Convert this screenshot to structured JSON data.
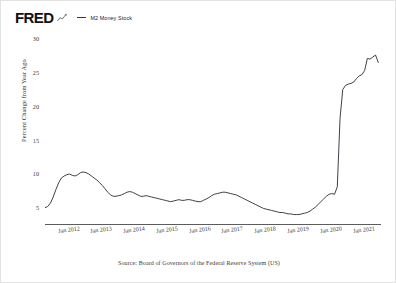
{
  "header": {
    "logo_text": "FRED",
    "logo_mark_icon": "mini-line-chart-icon",
    "legend": [
      {
        "label": "M2 Money Stock",
        "color": "#33383f",
        "swatch_icon": "line-swatch-icon"
      }
    ]
  },
  "source_note": "Source: Board of Governors of the Federal Reserve System (US)",
  "chart_data": {
    "type": "line",
    "title": "",
    "xlabel": "",
    "ylabel": "Percent Change from Year Ago",
    "ylim": [
      2.5,
      31.5
    ],
    "yticks": [
      5,
      10,
      15,
      20,
      25,
      30
    ],
    "ytick_labels": [
      "5",
      "10",
      "15",
      "20",
      "25",
      "30"
    ],
    "xlim": [
      "2011-04",
      "2021-07"
    ],
    "xticks": [
      "2012-01",
      "2013-01",
      "2014-01",
      "2015-01",
      "2016-01",
      "2017-01",
      "2018-01",
      "2019-01",
      "2020-01",
      "2021-01"
    ],
    "xtick_labels": [
      "Jan 2012",
      "Jan 2013",
      "Jan 2014",
      "Jan 2015",
      "Jan 2016",
      "Jan 2017",
      "Jan 2018",
      "Jan 2019",
      "Jan 2020",
      "Jan 2021"
    ],
    "grid": false,
    "legend_position": "top-left",
    "series": [
      {
        "name": "M2 Money Stock",
        "color": "#33383f",
        "x": [
          "2011-04",
          "2011-05",
          "2011-06",
          "2011-07",
          "2011-08",
          "2011-09",
          "2011-10",
          "2011-11",
          "2011-12",
          "2012-01",
          "2012-02",
          "2012-03",
          "2012-04",
          "2012-05",
          "2012-06",
          "2012-07",
          "2012-08",
          "2012-09",
          "2012-10",
          "2012-11",
          "2012-12",
          "2013-01",
          "2013-02",
          "2013-03",
          "2013-04",
          "2013-05",
          "2013-06",
          "2013-07",
          "2013-08",
          "2013-09",
          "2013-10",
          "2013-11",
          "2013-12",
          "2014-01",
          "2014-02",
          "2014-03",
          "2014-04",
          "2014-05",
          "2014-06",
          "2014-07",
          "2014-08",
          "2014-09",
          "2014-10",
          "2014-11",
          "2014-12",
          "2015-01",
          "2015-02",
          "2015-03",
          "2015-04",
          "2015-05",
          "2015-06",
          "2015-07",
          "2015-08",
          "2015-09",
          "2015-10",
          "2015-11",
          "2015-12",
          "2016-01",
          "2016-02",
          "2016-03",
          "2016-04",
          "2016-05",
          "2016-06",
          "2016-07",
          "2016-08",
          "2016-09",
          "2016-10",
          "2016-11",
          "2016-12",
          "2017-01",
          "2017-02",
          "2017-03",
          "2017-04",
          "2017-05",
          "2017-06",
          "2017-07",
          "2017-08",
          "2017-09",
          "2017-10",
          "2017-11",
          "2017-12",
          "2018-01",
          "2018-02",
          "2018-03",
          "2018-04",
          "2018-05",
          "2018-06",
          "2018-07",
          "2018-08",
          "2018-09",
          "2018-10",
          "2018-11",
          "2018-12",
          "2019-01",
          "2019-02",
          "2019-03",
          "2019-04",
          "2019-05",
          "2019-06",
          "2019-07",
          "2019-08",
          "2019-09",
          "2019-10",
          "2019-11",
          "2019-12",
          "2020-01",
          "2020-02",
          "2020-03",
          "2020-04",
          "2020-05",
          "2020-06",
          "2020-07",
          "2020-08",
          "2020-09",
          "2020-10",
          "2020-11",
          "2020-12",
          "2021-01",
          "2021-02",
          "2021-03",
          "2021-04",
          "2021-05",
          "2021-06"
        ],
        "values": [
          4.9,
          5.1,
          5.6,
          6.5,
          7.6,
          8.6,
          9.3,
          9.6,
          9.8,
          9.9,
          9.7,
          9.6,
          9.8,
          10.1,
          10.2,
          10.1,
          9.9,
          9.6,
          9.3,
          9.0,
          8.6,
          8.2,
          7.7,
          7.2,
          6.8,
          6.6,
          6.6,
          6.7,
          6.8,
          7.0,
          7.2,
          7.3,
          7.2,
          7.0,
          6.8,
          6.6,
          6.6,
          6.7,
          6.6,
          6.5,
          6.4,
          6.3,
          6.2,
          6.1,
          6.0,
          5.9,
          5.8,
          5.9,
          6.0,
          6.1,
          6.0,
          6.0,
          6.1,
          6.1,
          6.0,
          5.9,
          5.8,
          5.8,
          6.0,
          6.2,
          6.4,
          6.7,
          6.9,
          7.0,
          7.1,
          7.2,
          7.2,
          7.1,
          7.0,
          6.9,
          6.8,
          6.6,
          6.4,
          6.2,
          6.0,
          5.8,
          5.6,
          5.4,
          5.2,
          5.0,
          4.8,
          4.7,
          4.6,
          4.5,
          4.4,
          4.3,
          4.2,
          4.2,
          4.1,
          4.0,
          4.0,
          3.9,
          3.9,
          3.9,
          4.0,
          4.1,
          4.2,
          4.4,
          4.7,
          5.0,
          5.4,
          5.8,
          6.2,
          6.6,
          6.9,
          7.0,
          6.9,
          8.0,
          18.1,
          22.4,
          23.0,
          23.2,
          23.3,
          23.5,
          24.0,
          24.4,
          24.6,
          25.2,
          27.0,
          26.9,
          27.2,
          27.5,
          26.4
        ]
      }
    ]
  }
}
